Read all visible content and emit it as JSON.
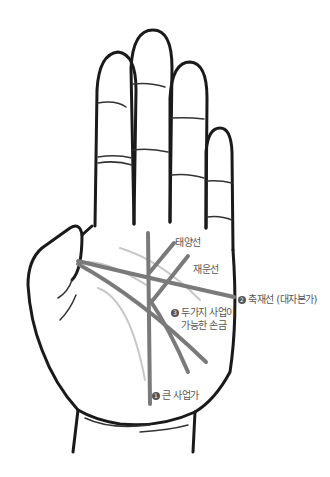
{
  "diagram": {
    "colors": {
      "outline": "#1a1a1a",
      "line_dark": "#7a7a7a",
      "line_light": "#c8c8c8",
      "label_text": "#555555",
      "background": "#ffffff"
    },
    "labels": {
      "sun_line": "태양선",
      "wealth_line": "재운선",
      "item2": {
        "number": "2",
        "text": "축재선 (대자본가)"
      },
      "item3": {
        "number": "3",
        "text_line1": "두가지 사업이",
        "text_line2": "가능한 손금"
      },
      "item1": {
        "number": "1",
        "text": "큰 사업가"
      }
    }
  }
}
